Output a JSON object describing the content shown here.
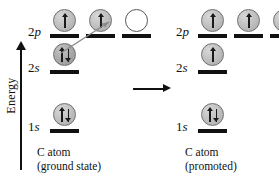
{
  "figure": {
    "axis": {
      "label": "Energy",
      "direction_icon": "up-arrow-icon"
    },
    "transition_arrow": {
      "icon": "right-arrow-icon"
    },
    "promotion_arrow": {
      "icon": "curved-promotion-arrow-icon",
      "description": "arrow from 2s to empty 2p orbital"
    }
  },
  "panels": [
    {
      "id": "ground-state",
      "caption_line1": "C atom",
      "caption_line2": "(ground state)",
      "levels": [
        {
          "id": "2p",
          "label_n": "2",
          "label_l": "p",
          "orbitals": [
            {
              "occupancy": "single-up",
              "style": "filled"
            },
            {
              "occupancy": "single-up",
              "style": "filled"
            },
            {
              "occupancy": "empty",
              "style": "empty"
            }
          ]
        },
        {
          "id": "2s",
          "label_n": "2",
          "label_l": "s",
          "orbitals": [
            {
              "occupancy": "paired",
              "style": "filled-dark"
            }
          ]
        },
        {
          "id": "1s",
          "label_n": "1",
          "label_l": "s",
          "orbitals": [
            {
              "occupancy": "paired",
              "style": "filled"
            }
          ]
        }
      ]
    },
    {
      "id": "promoted",
      "caption_line1": "C atom",
      "caption_line2": "(promoted)",
      "levels": [
        {
          "id": "2p",
          "label_n": "2",
          "label_l": "p",
          "orbitals": [
            {
              "occupancy": "single-up",
              "style": "filled"
            },
            {
              "occupancy": "single-up",
              "style": "filled"
            },
            {
              "occupancy": "single-up",
              "style": "filled"
            }
          ]
        },
        {
          "id": "2s",
          "label_n": "2",
          "label_l": "s",
          "orbitals": [
            {
              "occupancy": "single-up",
              "style": "filled"
            }
          ]
        },
        {
          "id": "1s",
          "label_n": "1",
          "label_l": "s",
          "orbitals": [
            {
              "occupancy": "paired",
              "style": "filled"
            }
          ]
        }
      ]
    }
  ],
  "colors": {
    "ink": "#111111",
    "sphere_fill": "#c2c2c2",
    "sphere_fill_dark": "#ababab",
    "sphere_stroke": "#6f6f6f",
    "background": "#ffffff"
  }
}
